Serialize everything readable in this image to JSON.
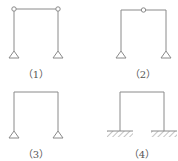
{
  "figures": [
    {
      "id": 1,
      "label": "（1）",
      "type": "two-hinged frame with hinges at both top corners",
      "supports": [
        "pin",
        "pin"
      ],
      "hinges": [
        "top-left",
        "top-right"
      ]
    },
    {
      "id": 2,
      "label": "（2）",
      "type": "three-hinged frame with hinge at beam midspan",
      "supports": [
        "pin",
        "pin"
      ],
      "hinges": [
        "beam-middle"
      ]
    },
    {
      "id": 3,
      "label": "（3）",
      "type": "rigid portal frame on pinned supports",
      "supports": [
        "pin",
        "pin"
      ],
      "hinges": []
    },
    {
      "id": 4,
      "label": "（4）",
      "type": "rigid portal frame with fixed bases",
      "supports": [
        "fixed",
        "fixed"
      ],
      "hinges": []
    }
  ],
  "colors": {
    "line": "#8a8a8a",
    "text": "#555555",
    "background": "#ffffff"
  }
}
